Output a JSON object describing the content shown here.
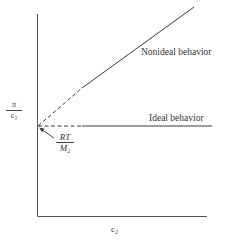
{
  "diagram": {
    "type": "line-plot-schematic",
    "y_axis_label": {
      "numerator": "π",
      "denominator": "c₂"
    },
    "x_axis_label": "c₂",
    "intercept_label": {
      "numerator": "RT",
      "denominator": "M₂"
    },
    "lines": [
      {
        "name": "Nonideal behavior",
        "style": "dashed-then-solid",
        "slope": "positive"
      },
      {
        "name": "Ideal behavior",
        "style": "dashed-then-solid",
        "slope": "zero"
      }
    ],
    "labels": {
      "nonideal": "Nonideal behavior",
      "ideal": "Ideal behavior"
    },
    "colors": {
      "line": "#3a3a3a",
      "axis": "#555555",
      "background": "#ffffff"
    }
  }
}
